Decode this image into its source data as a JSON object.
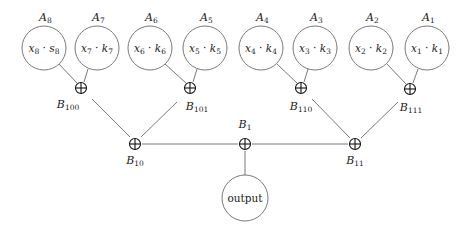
{
  "diagram": {
    "title": "",
    "leaves": [
      {
        "id": "A8",
        "label": "A",
        "label_sub": "8",
        "text_x": "x",
        "text_xsub": "8",
        "text_k": "s",
        "text_ksub": "8",
        "cx": 44,
        "cy": 48
      },
      {
        "id": "A7",
        "label": "A",
        "label_sub": "7",
        "text_x": "x",
        "text_xsub": "7",
        "text_k": "k",
        "text_ksub": "7",
        "cx": 97,
        "cy": 48
      },
      {
        "id": "A6",
        "label": "A",
        "label_sub": "6",
        "text_x": "x",
        "text_xsub": "6",
        "text_k": "k",
        "text_ksub": "6",
        "cx": 150,
        "cy": 48
      },
      {
        "id": "A5",
        "label": "A",
        "label_sub": "5",
        "text_x": "x",
        "text_xsub": "5",
        "text_k": "k",
        "text_ksub": "5",
        "cx": 205,
        "cy": 48
      },
      {
        "id": "A4",
        "label": "A",
        "label_sub": "4",
        "text_x": "x",
        "text_xsub": "4",
        "text_k": "k",
        "text_ksub": "4",
        "cx": 261,
        "cy": 48
      },
      {
        "id": "A3",
        "label": "A",
        "label_sub": "3",
        "text_x": "x",
        "text_xsub": "3",
        "text_k": "k",
        "text_ksub": "3",
        "cx": 315,
        "cy": 48
      },
      {
        "id": "A2",
        "label": "A",
        "label_sub": "2",
        "text_x": "x",
        "text_xsub": "2",
        "text_k": "k",
        "text_ksub": "2",
        "cx": 371,
        "cy": 48
      },
      {
        "id": "A1",
        "label": "A",
        "label_sub": "1",
        "text_x": "x",
        "text_xsub": "1",
        "text_k": "k",
        "text_ksub": "1",
        "cx": 427,
        "cy": 48
      }
    ],
    "sum_nodes": [
      {
        "id": "B100",
        "label": "B",
        "label_sub": "100",
        "x": 81,
        "y": 88,
        "label_pos": "below-left"
      },
      {
        "id": "B101",
        "label": "B",
        "label_sub": "101",
        "x": 190,
        "y": 88,
        "label_pos": "below-right"
      },
      {
        "id": "B110",
        "label": "B",
        "label_sub": "110",
        "x": 301,
        "y": 88,
        "label_pos": "below"
      },
      {
        "id": "B111",
        "label": "B",
        "label_sub": "111",
        "x": 410,
        "y": 89,
        "label_pos": "below-right"
      },
      {
        "id": "B10",
        "label": "B",
        "label_sub": "10",
        "x": 135,
        "y": 143,
        "label_pos": "below"
      },
      {
        "id": "B1",
        "label": "B",
        "label_sub": "1",
        "x": 245,
        "y": 144,
        "label_pos": "above"
      },
      {
        "id": "B11",
        "label": "B",
        "label_sub": "11",
        "x": 355,
        "y": 144,
        "label_pos": "below"
      }
    ],
    "output": {
      "label": "output",
      "cx": 245,
      "cy": 198
    },
    "operator_symbol": "⊕"
  }
}
